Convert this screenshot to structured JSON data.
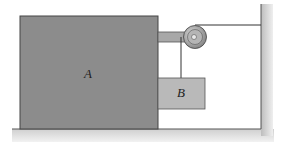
{
  "diagram": {
    "type": "mechanics-pulley-system",
    "labels": {
      "block_a": "A",
      "block_b": "B"
    },
    "colors": {
      "block_a": "#8c8c8c",
      "block_b": "#b9b9b9",
      "ground": "#d9d9d9",
      "wall": "#cfcfcf",
      "arm": "#a8a8a8",
      "pulley": "#9a9a9a",
      "line": "#333333"
    }
  }
}
